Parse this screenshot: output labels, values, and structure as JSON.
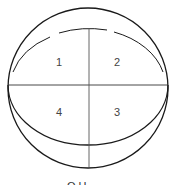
{
  "diagram": {
    "type": "quadrant-ellipse",
    "stroke_color": "#1a1a1a",
    "quadrants": [
      {
        "id": "q1",
        "label": "1",
        "position": "upper-left"
      },
      {
        "id": "q2",
        "label": "2",
        "position": "upper-right"
      },
      {
        "id": "q3",
        "label": "3",
        "position": "lower-right"
      },
      {
        "id": "q4",
        "label": "4",
        "position": "lower-left"
      }
    ],
    "caption": "O  H"
  }
}
